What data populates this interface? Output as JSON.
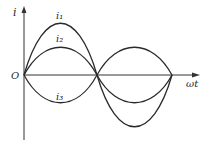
{
  "diagram": {
    "type": "three-phase sinusoidal currents",
    "axes": {
      "y_label": "i",
      "x_label": "ωt",
      "origin_label": "O"
    },
    "curves": [
      {
        "name": "i1",
        "label": "i₁",
        "amplitude_px": 52,
        "phase": "0",
        "color": "#2a2a2a"
      },
      {
        "name": "i2",
        "label": "i₂",
        "amplitude_px": 28,
        "phase": "0",
        "color": "#2a2a2a"
      },
      {
        "name": "i3",
        "label": "i₃",
        "amplitude_px": 28,
        "phase": "π",
        "color": "#2a2a2a"
      }
    ],
    "zero_crossings_px": [
      24,
      97,
      172
    ]
  }
}
